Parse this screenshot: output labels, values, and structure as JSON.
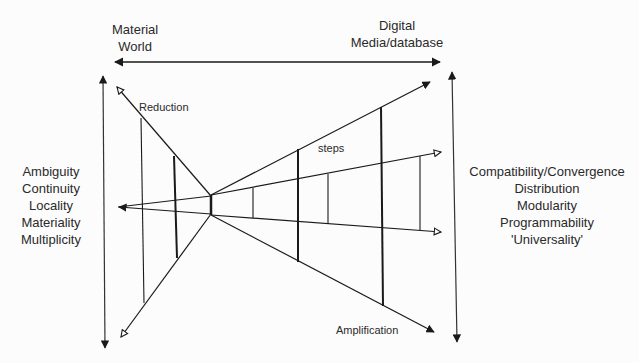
{
  "top_axis": {
    "left_label_line1": "Material",
    "left_label_line2": "World",
    "right_label_line1": "Digital",
    "right_label_line2": "Media/database"
  },
  "left_properties": [
    "Ambiguity",
    "Continuity",
    "Locality",
    "Materiality",
    "Multiplicity"
  ],
  "right_properties": [
    "Compatibility/Convergence",
    "Distribution",
    "Modularity",
    "Programmability",
    "'Universality'"
  ],
  "annotations": {
    "reduction": "Reduction",
    "steps": "steps",
    "amplification": "Amplification"
  },
  "colors": {
    "line": "#1a1a1a",
    "background": "#fcfcfc"
  }
}
